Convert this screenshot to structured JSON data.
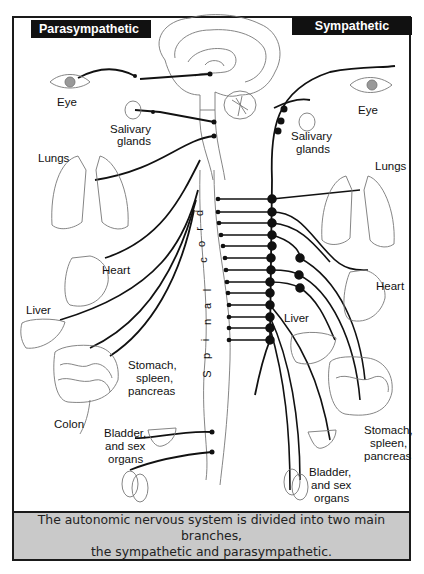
{
  "headers": {
    "left": "Parasympathetic",
    "right": "Sympathetic"
  },
  "spinal_cord_label": [
    "S",
    "p",
    "i",
    "n",
    "a",
    "l",
    " ",
    "c",
    "o",
    "r",
    "d"
  ],
  "parasympathetic_labels": {
    "eye": "Eye",
    "salivary_1": "Salivary",
    "salivary_2": "glands",
    "lungs": "Lungs",
    "heart": "Heart",
    "liver": "Liver",
    "stomach_1": "Stomach,",
    "stomach_2": "spleen,",
    "stomach_3": "pancreas",
    "colon": "Colon",
    "bladder_1": "Bladder,",
    "bladder_2": "and sex",
    "bladder_3": "organs"
  },
  "sympathetic_labels": {
    "eye": "Eye",
    "salivary_1": "Salivary",
    "salivary_2": "glands",
    "lungs": "Lungs",
    "heart": "Heart",
    "liver": "Liver",
    "stomach_1": "Stomach,",
    "stomach_2": "spleen,",
    "stomach_3": "pancreas",
    "bladder_1": "Bladder,",
    "bladder_2": "and sex",
    "bladder_3": "organs"
  },
  "caption": {
    "line1": "The autonomic nervous system is divided into two main branches,",
    "line2": "the sympathetic and parasympathetic."
  },
  "colors": {
    "header_bg": "#111111",
    "caption_bg": "#c9c9c9",
    "line": "#111111",
    "outline": "#777777"
  }
}
